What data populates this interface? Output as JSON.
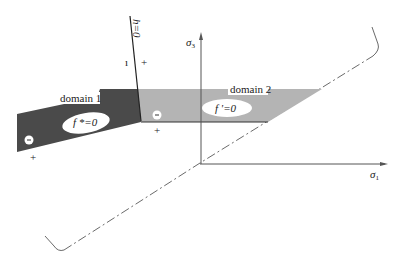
{
  "diagram": {
    "type": "yield-surface-domains",
    "colors": {
      "background": "#ffffff",
      "domain1_fill": "#4a4a4a",
      "domain2_fill": "#b4b4b4",
      "axis": "#555555",
      "line": "#333333",
      "ellipse": "#ffffff"
    },
    "axes": {
      "sigma3": {
        "label_base": "σ",
        "label_sub": "3"
      },
      "sigma1": {
        "label_base": "σ",
        "label_sub": "1"
      }
    },
    "boundary": {
      "label": "h=0",
      "minus_sign": "ı",
      "plus_sign": "+"
    },
    "domain1": {
      "label": "domain 1",
      "surface_label": "f *=0",
      "minus_marker": "−",
      "plus_marker": "+"
    },
    "domain2": {
      "label": "domain 2",
      "surface_label": "f '=0",
      "minus_marker": "−",
      "plus_marker": "+"
    },
    "hydrostatic_axis": {
      "style": "dash-dot"
    }
  }
}
